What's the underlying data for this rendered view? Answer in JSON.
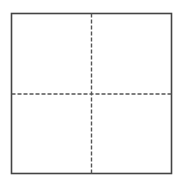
{
  "diagram": {
    "type": "quadrant-grid",
    "rows": 2,
    "columns": 2,
    "outer_box": {
      "x": 11.5,
      "y": 13.5,
      "width": 160,
      "height": 160,
      "stroke": "#444444",
      "stroke_width": 1.6
    },
    "divider_vertical": {
      "x": 91.5,
      "y1": 13.5,
      "y2": 173.5,
      "stroke": "#555555",
      "dash": "4 2"
    },
    "divider_horizontal": {
      "y": 94,
      "x1": 11.5,
      "x2": 171.5,
      "stroke": "#555555",
      "dash": "4 2"
    },
    "background": "#ffffff"
  }
}
